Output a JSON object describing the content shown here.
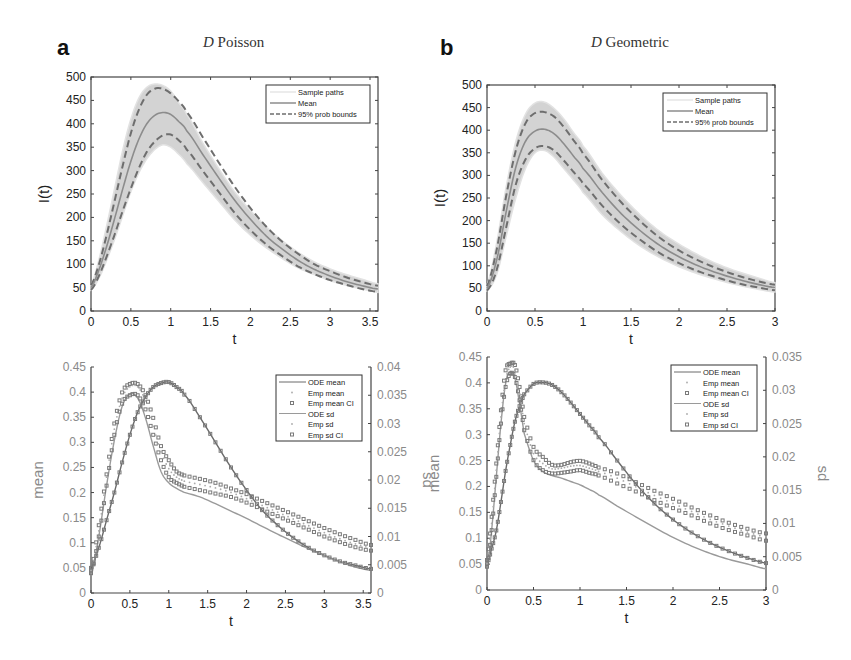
{
  "panels": [
    {
      "letter": "a",
      "title_italic": "D",
      "title_rest": " Poisson"
    },
    {
      "letter": "b",
      "title_italic": "D",
      "title_rest": " Geometric"
    }
  ],
  "colors": {
    "band": "#d3d3d3",
    "mean_line": "#8c8c8c",
    "bounds": "#6e6e6e",
    "axis": "#444444",
    "ode_mean": "#6a6a6a",
    "ode_sd": "#9a9a9a",
    "markers": "#7a7a7a"
  },
  "chart_data": [
    {
      "id": "a-top",
      "type": "line",
      "title": "D Poisson",
      "xlabel": "t",
      "ylabel": "I(t)",
      "xlim": [
        0,
        3.6
      ],
      "ylim": [
        0,
        500
      ],
      "xticks": [
        0,
        0.5,
        1,
        1.5,
        2,
        2.5,
        3,
        3.5
      ],
      "yticks": [
        0,
        50,
        100,
        150,
        200,
        250,
        300,
        350,
        400,
        450,
        500
      ],
      "legend": [
        "Sample paths",
        "Mean",
        "95% prob bounds"
      ],
      "legend_position": "upper right",
      "x": [
        0,
        0.1,
        0.2,
        0.3,
        0.4,
        0.5,
        0.6,
        0.7,
        0.8,
        0.9,
        1.0,
        1.1,
        1.2,
        1.4,
        1.6,
        1.8,
        2.0,
        2.2,
        2.4,
        2.6,
        2.8,
        3.0,
        3.2,
        3.4,
        3.6
      ],
      "series": [
        {
          "name": "Sample paths (max envelope)",
          "values": [
            55,
            110,
            185,
            265,
            345,
            410,
            455,
            478,
            485,
            482,
            470,
            445,
            420,
            360,
            305,
            255,
            215,
            180,
            150,
            125,
            105,
            90,
            78,
            68,
            58
          ]
        },
        {
          "name": "Sample paths (min envelope)",
          "values": [
            45,
            70,
            110,
            155,
            205,
            255,
            295,
            325,
            345,
            355,
            350,
            335,
            315,
            275,
            235,
            195,
            162,
            135,
            112,
            92,
            78,
            65,
            55,
            47,
            40
          ]
        },
        {
          "name": "Mean",
          "values": [
            50,
            88,
            140,
            200,
            262,
            320,
            367,
            400,
            418,
            424,
            420,
            405,
            385,
            335,
            285,
            237,
            196,
            160,
            132,
            108,
            89,
            75,
            63,
            54,
            47
          ]
        },
        {
          "name": "95% prob bounds (upper)",
          "values": [
            55,
            100,
            165,
            238,
            312,
            380,
            430,
            462,
            475,
            475,
            465,
            448,
            425,
            372,
            318,
            266,
            220,
            180,
            148,
            122,
            100,
            85,
            72,
            62,
            54
          ]
        },
        {
          "name": "95% prob bounds (lower)",
          "values": [
            45,
            75,
            118,
            165,
            215,
            262,
            305,
            340,
            362,
            375,
            377,
            365,
            345,
            300,
            255,
            210,
            173,
            142,
            117,
            95,
            79,
            66,
            56,
            47,
            41
          ]
        }
      ]
    },
    {
      "id": "b-top",
      "type": "line",
      "title": "D Geometric",
      "xlabel": "t",
      "ylabel": "I(t)",
      "xlim": [
        0,
        3
      ],
      "ylim": [
        0,
        500
      ],
      "xticks": [
        0,
        0.5,
        1,
        1.5,
        2,
        2.5,
        3
      ],
      "yticks": [
        0,
        50,
        100,
        150,
        200,
        250,
        300,
        350,
        400,
        450,
        500
      ],
      "legend": [
        "Sample paths",
        "Mean",
        "95% prob bounds"
      ],
      "legend_position": "upper right",
      "x": [
        0,
        0.1,
        0.2,
        0.3,
        0.4,
        0.5,
        0.6,
        0.7,
        0.8,
        0.9,
        1.0,
        1.2,
        1.4,
        1.6,
        1.8,
        2.0,
        2.2,
        2.4,
        2.6,
        2.8,
        3.0
      ],
      "series": [
        {
          "name": "Sample paths (max envelope)",
          "values": [
            58,
            150,
            275,
            375,
            435,
            460,
            462,
            448,
            425,
            395,
            365,
            305,
            255,
            212,
            176,
            148,
            124,
            104,
            88,
            75,
            63
          ]
        },
        {
          "name": "Sample paths (min envelope)",
          "values": [
            45,
            80,
            165,
            250,
            315,
            350,
            355,
            340,
            315,
            290,
            262,
            213,
            175,
            143,
            118,
            98,
            82,
            69,
            58,
            49,
            42
          ]
        },
        {
          "name": "Mean",
          "values": [
            50,
            112,
            220,
            318,
            375,
            398,
            402,
            392,
            370,
            343,
            315,
            262,
            215,
            177,
            145,
            120,
            100,
            84,
            71,
            60,
            52
          ]
        },
        {
          "name": "95% prob bounds (upper)",
          "values": [
            55,
            135,
            255,
            355,
            415,
            438,
            440,
            430,
            407,
            378,
            348,
            290,
            240,
            198,
            162,
            134,
            112,
            94,
            79,
            67,
            58
          ]
        },
        {
          "name": "95% prob bounds (lower)",
          "values": [
            45,
            90,
            185,
            280,
            335,
            360,
            365,
            355,
            333,
            308,
            282,
            233,
            191,
            157,
            128,
            106,
            88,
            74,
            62,
            53,
            46
          ]
        }
      ]
    },
    {
      "id": "a-bottom",
      "type": "line",
      "title": "",
      "xlabel": "t",
      "ylabel": "mean",
      "ylabel_right": "sd",
      "xlim": [
        0,
        3.6
      ],
      "ylim": [
        0,
        0.45
      ],
      "ylim_right": [
        0,
        0.04
      ],
      "xticks": [
        0,
        0.5,
        1,
        1.5,
        2,
        2.5,
        3,
        3.5
      ],
      "yticks": [
        0,
        0.05,
        0.1,
        0.15,
        0.2,
        0.25,
        0.3,
        0.35,
        0.4,
        0.45
      ],
      "yticks_right": [
        0,
        0.005,
        0.01,
        0.015,
        0.02,
        0.025,
        0.03,
        0.035,
        0.04
      ],
      "legend": [
        "ODE mean",
        "Emp mean",
        "Emp mean CI",
        "ODE sd",
        "Emp sd",
        "Emp sd CI"
      ],
      "legend_position": "upper right",
      "x": [
        0,
        0.1,
        0.2,
        0.3,
        0.4,
        0.5,
        0.6,
        0.7,
        0.8,
        0.9,
        1.0,
        1.1,
        1.2,
        1.4,
        1.6,
        1.8,
        2.0,
        2.2,
        2.4,
        2.6,
        2.8,
        3.0,
        3.2,
        3.4,
        3.6
      ],
      "series": [
        {
          "name": "ODE mean",
          "axis": "left",
          "values": [
            0.05,
            0.09,
            0.145,
            0.2,
            0.26,
            0.315,
            0.36,
            0.39,
            0.41,
            0.418,
            0.42,
            0.41,
            0.395,
            0.35,
            0.3,
            0.25,
            0.205,
            0.165,
            0.135,
            0.11,
            0.09,
            0.075,
            0.063,
            0.055,
            0.048
          ]
        },
        {
          "name": "Emp mean",
          "axis": "left",
          "values": [
            0.05,
            0.09,
            0.145,
            0.2,
            0.26,
            0.315,
            0.36,
            0.39,
            0.41,
            0.418,
            0.42,
            0.41,
            0.395,
            0.35,
            0.3,
            0.25,
            0.205,
            0.165,
            0.135,
            0.11,
            0.09,
            0.075,
            0.063,
            0.055,
            0.048
          ]
        },
        {
          "name": "ODE sd",
          "axis": "right",
          "values": [
            0.003,
            0.01,
            0.019,
            0.027,
            0.033,
            0.0352,
            0.0345,
            0.031,
            0.026,
            0.0215,
            0.0195,
            0.0185,
            0.0178,
            0.017,
            0.0158,
            0.0145,
            0.0132,
            0.0118,
            0.0104,
            0.0091,
            0.0078,
            0.0066,
            0.0055,
            0.0046,
            0.004
          ]
        },
        {
          "name": "Emp sd",
          "axis": "right",
          "values": [
            0.004,
            0.011,
            0.0205,
            0.029,
            0.0345,
            0.0365,
            0.0365,
            0.034,
            0.0295,
            0.025,
            0.022,
            0.0205,
            0.0198,
            0.0192,
            0.0186,
            0.0178,
            0.0167,
            0.0155,
            0.0143,
            0.0131,
            0.0119,
            0.0107,
            0.0096,
            0.0087,
            0.008
          ]
        },
        {
          "name": "Emp sd CI (upper)",
          "axis": "right",
          "values": [
            0.004,
            0.012,
            0.021,
            0.03,
            0.0355,
            0.037,
            0.037,
            0.035,
            0.031,
            0.026,
            0.0235,
            0.0215,
            0.0208,
            0.0202,
            0.0195,
            0.0185,
            0.0175,
            0.0163,
            0.0151,
            0.0139,
            0.0127,
            0.0115,
            0.0104,
            0.0094,
            0.0085
          ]
        },
        {
          "name": "Emp sd CI (lower)",
          "axis": "right",
          "values": [
            0.0035,
            0.01,
            0.019,
            0.028,
            0.0335,
            0.035,
            0.035,
            0.0325,
            0.028,
            0.0235,
            0.0205,
            0.0195,
            0.0188,
            0.0182,
            0.0176,
            0.017,
            0.016,
            0.0148,
            0.0136,
            0.0124,
            0.0112,
            0.01,
            0.009,
            0.0081,
            0.0075
          ]
        }
      ]
    },
    {
      "id": "b-bottom",
      "type": "line",
      "title": "",
      "xlabel": "t",
      "ylabel": "mean",
      "ylabel_right": "sd",
      "xlim": [
        0,
        3
      ],
      "ylim": [
        0,
        0.45
      ],
      "ylim_right": [
        0,
        0.035
      ],
      "xticks": [
        0,
        0.5,
        1,
        1.5,
        2,
        2.5,
        3
      ],
      "yticks": [
        0,
        0.05,
        0.1,
        0.15,
        0.2,
        0.25,
        0.3,
        0.35,
        0.4,
        0.45
      ],
      "yticks_right": [
        0,
        0.005,
        0.01,
        0.015,
        0.02,
        0.025,
        0.03,
        0.035
      ],
      "legend": [
        "ODE mean",
        "Emp mean",
        "Emp mean CI",
        "ODE sd",
        "Emp sd",
        "Emp sd CI"
      ],
      "legend_position": "upper right",
      "x": [
        0,
        0.05,
        0.1,
        0.15,
        0.2,
        0.25,
        0.3,
        0.35,
        0.4,
        0.5,
        0.6,
        0.7,
        0.8,
        0.9,
        1.0,
        1.1,
        1.2,
        1.4,
        1.6,
        1.8,
        2.0,
        2.2,
        2.4,
        2.6,
        2.8,
        3.0
      ],
      "series": [
        {
          "name": "ODE mean",
          "axis": "left",
          "values": [
            0.05,
            0.08,
            0.115,
            0.17,
            0.23,
            0.28,
            0.325,
            0.355,
            0.378,
            0.398,
            0.401,
            0.396,
            0.382,
            0.362,
            0.34,
            0.318,
            0.295,
            0.25,
            0.205,
            0.167,
            0.136,
            0.111,
            0.091,
            0.075,
            0.062,
            0.052
          ]
        },
        {
          "name": "Emp mean",
          "axis": "left",
          "values": [
            0.05,
            0.08,
            0.115,
            0.17,
            0.23,
            0.28,
            0.325,
            0.355,
            0.378,
            0.398,
            0.401,
            0.396,
            0.382,
            0.362,
            0.34,
            0.318,
            0.295,
            0.25,
            0.205,
            0.167,
            0.136,
            0.111,
            0.091,
            0.075,
            0.062,
            0.052
          ]
        },
        {
          "name": "ODE sd",
          "axis": "right",
          "values": [
            0.003,
            0.009,
            0.017,
            0.025,
            0.031,
            0.0328,
            0.0318,
            0.028,
            0.0235,
            0.0195,
            0.0178,
            0.0172,
            0.0168,
            0.0163,
            0.0158,
            0.0151,
            0.0143,
            0.0126,
            0.011,
            0.0094,
            0.0079,
            0.0066,
            0.0055,
            0.0046,
            0.0039,
            0.0032
          ]
        },
        {
          "name": "Emp sd",
          "axis": "right",
          "values": [
            0.004,
            0.01,
            0.018,
            0.026,
            0.0315,
            0.0335,
            0.033,
            0.0295,
            0.025,
            0.0205,
            0.019,
            0.0182,
            0.0183,
            0.0186,
            0.0187,
            0.0183,
            0.0178,
            0.0168,
            0.0155,
            0.0142,
            0.013,
            0.0118,
            0.0106,
            0.0096,
            0.0087,
            0.008
          ]
        },
        {
          "name": "Emp sd CI (upper)",
          "axis": "right",
          "values": [
            0.0045,
            0.011,
            0.019,
            0.027,
            0.033,
            0.034,
            0.0338,
            0.0305,
            0.026,
            0.0215,
            0.02,
            0.0188,
            0.0188,
            0.0192,
            0.0194,
            0.019,
            0.0184,
            0.0175,
            0.0162,
            0.0149,
            0.0137,
            0.0124,
            0.0112,
            0.0101,
            0.0092,
            0.0085
          ]
        },
        {
          "name": "Emp sd CI (lower)",
          "axis": "right",
          "values": [
            0.0035,
            0.009,
            0.017,
            0.025,
            0.0305,
            0.0325,
            0.032,
            0.0285,
            0.024,
            0.0195,
            0.018,
            0.0175,
            0.0176,
            0.0178,
            0.018,
            0.0176,
            0.0172,
            0.016,
            0.0148,
            0.0135,
            0.0123,
            0.0112,
            0.01,
            0.009,
            0.0082,
            0.0074
          ]
        }
      ]
    }
  ]
}
